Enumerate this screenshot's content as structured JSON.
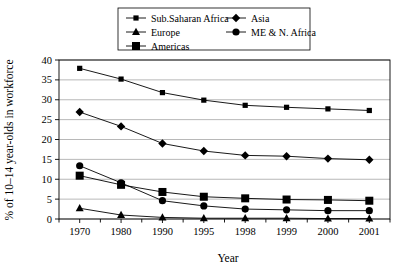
{
  "chart_data": {
    "type": "line",
    "title": "",
    "xlabel": "Year",
    "ylabel": "% of 10–14 year-olds in workforce",
    "categories": [
      "1970",
      "1980",
      "1990",
      "1995",
      "1998",
      "1999",
      "2000",
      "2001"
    ],
    "ylim": [
      0,
      40
    ],
    "ytick_step": 5,
    "yticks": [
      "0",
      "5",
      "10",
      "15",
      "20",
      "25",
      "30",
      "35",
      "40"
    ],
    "grid": true,
    "legend_position": "top-center",
    "series": [
      {
        "name": "Sub.Saharan Africa",
        "marker": "square-small",
        "values": [
          37.9,
          35.2,
          31.8,
          29.9,
          28.6,
          28.1,
          27.7,
          27.3
        ]
      },
      {
        "name": "Europe",
        "marker": "triangle",
        "values": [
          2.7,
          1.0,
          0.4,
          0.2,
          0.2,
          0.2,
          0.1,
          0.1
        ]
      },
      {
        "name": "Americas",
        "marker": "square-large",
        "values": [
          10.9,
          8.6,
          6.8,
          5.6,
          5.2,
          4.9,
          4.8,
          4.6
        ]
      },
      {
        "name": "Asia",
        "marker": "diamond",
        "values": [
          26.9,
          23.3,
          19.0,
          17.1,
          16.0,
          15.8,
          15.2,
          14.9
        ]
      },
      {
        "name": "ME & N. Africa",
        "marker": "circle",
        "values": [
          13.4,
          9.1,
          4.6,
          3.3,
          2.5,
          2.3,
          2.1,
          2.1
        ]
      }
    ]
  },
  "legend": {
    "entries": [
      {
        "label": "Sub.Saharan Africa",
        "marker": "square-small"
      },
      {
        "label": "Asia",
        "marker": "diamond"
      },
      {
        "label": "Europe",
        "marker": "triangle"
      },
      {
        "label": "ME & N. Africa",
        "marker": "circle"
      },
      {
        "label": "Americas",
        "marker": "square-large"
      }
    ]
  },
  "colors": {
    "foreground": "#000000",
    "grid": "#9a9a9a",
    "background": "#ffffff"
  }
}
